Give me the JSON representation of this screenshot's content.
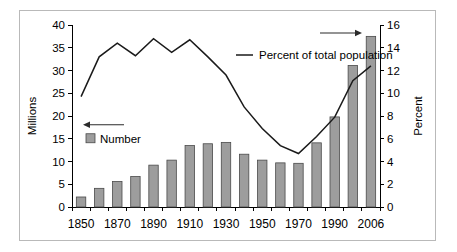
{
  "chart_data": {
    "type": "bar",
    "title": "",
    "subtitle": "",
    "xlabel": "",
    "ylabel": "Millions",
    "y2label": "Percent",
    "ylim": [
      0,
      40
    ],
    "y2lim": [
      0,
      16
    ],
    "yticks": [
      "0",
      "5",
      "10",
      "15",
      "20",
      "25",
      "30",
      "35",
      "40"
    ],
    "y2ticks": [
      "0",
      "2",
      "4",
      "6",
      "8",
      "10",
      "12",
      "14",
      "16"
    ],
    "grid": false,
    "legend_position": "inside",
    "categories": [
      "1850",
      "1860",
      "1870",
      "1880",
      "1890",
      "1900",
      "1910",
      "1920",
      "1930",
      "1940",
      "1950",
      "1960",
      "1970",
      "1980",
      "1990",
      "2000",
      "2006"
    ],
    "xtick_labels": [
      "1850",
      "",
      "1870",
      "",
      "1890",
      "",
      "1910",
      "",
      "1930",
      "",
      "1950",
      "",
      "1970",
      "",
      "1990",
      "",
      "2006"
    ],
    "series": [
      {
        "name": "Number",
        "type": "bar",
        "axis": "left",
        "unit": "Millions",
        "color": "#9d9d9d",
        "values": [
          2.2,
          4.1,
          5.6,
          6.7,
          9.2,
          10.3,
          13.5,
          13.9,
          14.2,
          11.6,
          10.3,
          9.7,
          9.6,
          14.1,
          19.8,
          31.1,
          37.5
        ]
      },
      {
        "name": "Percent of total population",
        "type": "line",
        "axis": "right",
        "unit": "Percent",
        "color": "#1a1a1a",
        "values": [
          9.7,
          13.2,
          14.4,
          13.3,
          14.8,
          13.6,
          14.7,
          13.2,
          11.6,
          8.8,
          6.9,
          5.4,
          4.7,
          6.2,
          7.9,
          11.1,
          12.4
        ]
      }
    ],
    "annotations": [
      {
        "name": "number-arrow",
        "points_to": "left-axis",
        "direction": "left"
      },
      {
        "name": "percent-arrow",
        "points_to": "right-axis",
        "direction": "right"
      }
    ]
  },
  "legend": {
    "bar_label": "Number",
    "line_label": "Percent of total population"
  },
  "axes": {
    "left_title": "Millions",
    "right_title": "Percent"
  }
}
